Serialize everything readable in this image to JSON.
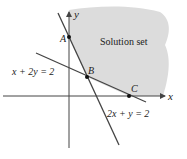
{
  "diagram": {
    "region_label": "Solution set",
    "axes": {
      "x_label": "x",
      "y_label": "y"
    },
    "lines": [
      {
        "equation": "x + 2y = 2",
        "a": 1,
        "b": 2,
        "c": 2
      },
      {
        "equation": "2x + y = 2",
        "a": 2,
        "b": 1,
        "c": 2
      }
    ],
    "points": [
      {
        "label": "A",
        "x": 0,
        "y": 2
      },
      {
        "label": "B",
        "x": 0.667,
        "y": 0.667
      },
      {
        "label": "C",
        "x": 2,
        "y": 0
      }
    ],
    "colors": {
      "region": "#dcdcdc",
      "lines": "#444444",
      "axes": "#444444"
    }
  }
}
